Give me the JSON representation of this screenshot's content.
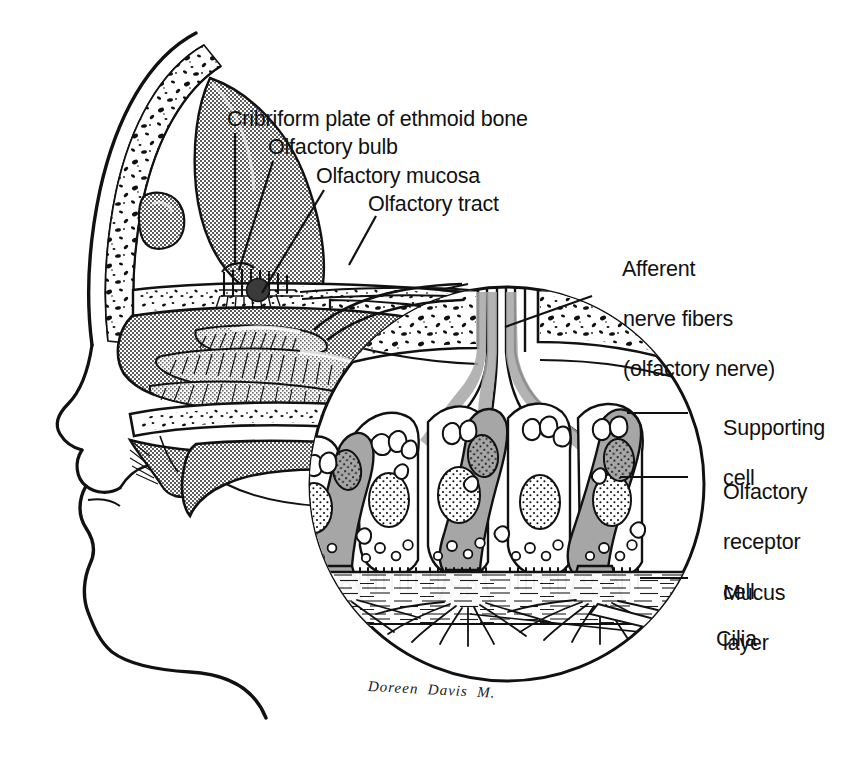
{
  "figure": {
    "style": "black-and-white line drawing with halftone gray shading"
  },
  "colors": {
    "ink": "#111111",
    "paper": "#ffffff",
    "tissue_gray": "#9a9a9a",
    "tissue_gray_light": "#b4b4b4",
    "cell_gray": "#a6a6a6",
    "bone_white": "#ffffff"
  },
  "labels": {
    "cribriform_plate": "Cribriform plate of ethmoid bone",
    "olfactory_bulb": "Olfactory bulb",
    "olfactory_mucosa": "Olfactory mucosa",
    "olfactory_tract": "Olfactory tract",
    "afferent_line1": "Afferent",
    "afferent_line2": "nerve fibers",
    "afferent_line3": "(olfactory nerve)",
    "supporting_line1": "Supporting",
    "supporting_line2": "cell",
    "receptor_line1": "Olfactory",
    "receptor_line2": "receptor",
    "receptor_line3": "cell",
    "mucus_line1": "Mucus",
    "mucus_line2": "layer",
    "cilia": "Cilia"
  },
  "signature": {
    "text": "Doreen  Davis  M."
  },
  "structures": {
    "head": [
      "skull vault",
      "frontal sinus",
      "nasal conchae",
      "hard palate",
      "tongue",
      "lips",
      "chin",
      "soft palate",
      "sphenoid sinus"
    ],
    "inset": [
      "cribriform plate bone",
      "olfactory nerve bundles",
      "supporting cells",
      "olfactory receptor cells",
      "cell nuclei",
      "olfactory knobs",
      "cilia",
      "mucus layer"
    ]
  }
}
